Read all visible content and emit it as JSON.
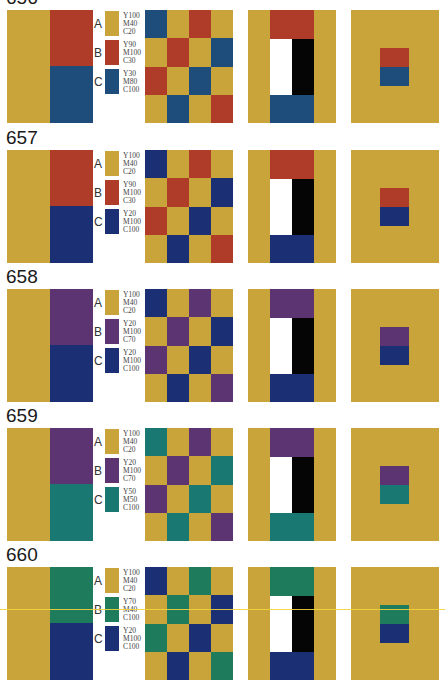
{
  "page": {
    "scan_artifact_line_y": 609
  },
  "colors": {
    "ground_yellow": "#C8A43B",
    "white": "#FFFFFF",
    "black": "#050505"
  },
  "plates": [
    {
      "number": "656",
      "top": -16,
      "swatches": [
        {
          "letter": "A",
          "cmyk": "Y100\nM40\nC20",
          "color": "#C8A43B"
        },
        {
          "letter": "B",
          "cmyk": "Y90\nM100\nC30",
          "color": "#AF3C28"
        },
        {
          "letter": "C",
          "cmyk": "Y30\nM80\nC100",
          "color": "#1E4D7B"
        }
      ],
      "checker": [
        "C",
        "A",
        "B",
        "A",
        "A",
        "B",
        "A",
        "C",
        "B",
        "A",
        "C",
        "A",
        "A",
        "C",
        "A",
        "B"
      ]
    },
    {
      "number": "657",
      "top": 124,
      "swatches": [
        {
          "letter": "A",
          "cmyk": "Y100\nM40\nC20",
          "color": "#C8A43B"
        },
        {
          "letter": "B",
          "cmyk": "Y90\nM100\nC30",
          "color": "#AF3C28"
        },
        {
          "letter": "C",
          "cmyk": "Y20\nM100\nC100",
          "color": "#1B2F74"
        }
      ],
      "checker": [
        "C",
        "A",
        "B",
        "A",
        "A",
        "B",
        "A",
        "C",
        "B",
        "A",
        "C",
        "A",
        "A",
        "C",
        "A",
        "B"
      ]
    },
    {
      "number": "658",
      "top": 263,
      "swatches": [
        {
          "letter": "A",
          "cmyk": "Y100\nM40\nC20",
          "color": "#C8A43B"
        },
        {
          "letter": "B",
          "cmyk": "Y20\nM100\nC70",
          "color": "#5C3472"
        },
        {
          "letter": "C",
          "cmyk": "Y20\nM100\nC100",
          "color": "#1B2F74"
        }
      ],
      "checker": [
        "C",
        "A",
        "B",
        "A",
        "A",
        "B",
        "A",
        "C",
        "B",
        "A",
        "C",
        "A",
        "A",
        "C",
        "A",
        "B"
      ]
    },
    {
      "number": "659",
      "top": 402,
      "swatches": [
        {
          "letter": "A",
          "cmyk": "Y100\nM40\nC20",
          "color": "#C8A43B"
        },
        {
          "letter": "B",
          "cmyk": "Y20\nM100\nC70",
          "color": "#5C3472"
        },
        {
          "letter": "C",
          "cmyk": "Y50\nM50\nC100",
          "color": "#197872"
        }
      ],
      "checker": [
        "C",
        "A",
        "B",
        "A",
        "A",
        "B",
        "A",
        "C",
        "B",
        "A",
        "C",
        "A",
        "A",
        "C",
        "A",
        "B"
      ]
    },
    {
      "number": "660",
      "top": 541,
      "swatches": [
        {
          "letter": "A",
          "cmyk": "Y100\nM40\nC20",
          "color": "#C8A43B"
        },
        {
          "letter": "B",
          "cmyk": "Y70\nM40\nC100",
          "color": "#1E7C5C"
        },
        {
          "letter": "C",
          "cmyk": "Y20\nM100\nC100",
          "color": "#1B2F74"
        }
      ],
      "checker": [
        "C",
        "A",
        "B",
        "A",
        "A",
        "B",
        "A",
        "C",
        "B",
        "A",
        "C",
        "A",
        "A",
        "C",
        "A",
        "B"
      ]
    }
  ]
}
